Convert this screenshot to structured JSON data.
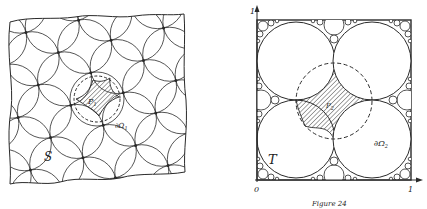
{
  "figure": {
    "left_panel": {
      "region_label": "S",
      "cell_label": "P",
      "cell_label_sub": "1",
      "boundary_label": "∂Ω",
      "boundary_label_sub": "1"
    },
    "right_panel": {
      "region_label": "T",
      "cell_label": "P",
      "cell_label_sub": "2",
      "boundary_label": "∂Ω",
      "boundary_label_sub": "2",
      "axis_origin": "0",
      "axis_x_end": "1",
      "axis_y_end": "1"
    },
    "caption": "Figure 24"
  },
  "colors": {
    "ink": "#2a2a2a",
    "paper": "#ffffff"
  }
}
